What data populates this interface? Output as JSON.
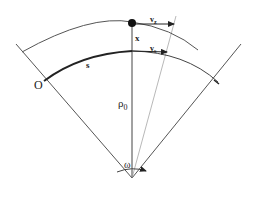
{
  "diagram": {
    "labels": {
      "origin": "O",
      "arc_length": "s",
      "offset": "x",
      "radius": "ρ",
      "radius_sub": "0",
      "velocity_particle": "v",
      "velocity_particle_sub": "z",
      "velocity_reference": "v",
      "velocity_reference_sub": "s",
      "angle": "ω"
    },
    "colors": {
      "line": "#555555",
      "thick_arc": "#222222",
      "particle": "#111111",
      "thin_ray": "#999999"
    }
  }
}
